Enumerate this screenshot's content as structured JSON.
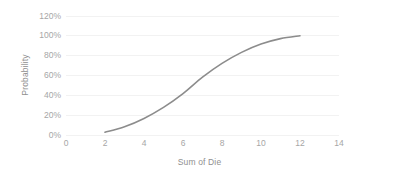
{
  "chart_data": {
    "type": "line",
    "title": "",
    "xlabel": "Sum of Die",
    "ylabel": "Probability",
    "x": [
      2,
      3,
      4,
      5,
      6,
      7,
      8,
      9,
      10,
      11,
      12
    ],
    "values": [
      2.8,
      8.3,
      16.7,
      27.8,
      41.7,
      58.3,
      72.2,
      83.3,
      91.7,
      97.2,
      100.0
    ],
    "series": [
      {
        "name": "Probability",
        "values": [
          2.8,
          8.3,
          16.7,
          27.8,
          41.7,
          58.3,
          72.2,
          83.3,
          91.7,
          97.2,
          100.0
        ]
      }
    ],
    "xlim": [
      0,
      14
    ],
    "ylim": [
      0,
      120
    ],
    "xticks": [
      0,
      2,
      4,
      6,
      8,
      10,
      12,
      14
    ],
    "xtick_labels": [
      "0",
      "2",
      "4",
      "6",
      "8",
      "10",
      "12",
      "14"
    ],
    "yticks": [
      0,
      20,
      40,
      60,
      80,
      100,
      120
    ],
    "ytick_labels": [
      "0%",
      "20%",
      "40%",
      "60%",
      "80%",
      "100%",
      "120%"
    ],
    "grid": "horizontal",
    "legend": "none",
    "smoothed": true,
    "line_color": "#8c8c8c",
    "gridline_color": "#f2f2f2",
    "background_color": "#ffffff",
    "tick_label_color": "#a6a6a6",
    "axis_title_color": "#8f8f8f"
  }
}
